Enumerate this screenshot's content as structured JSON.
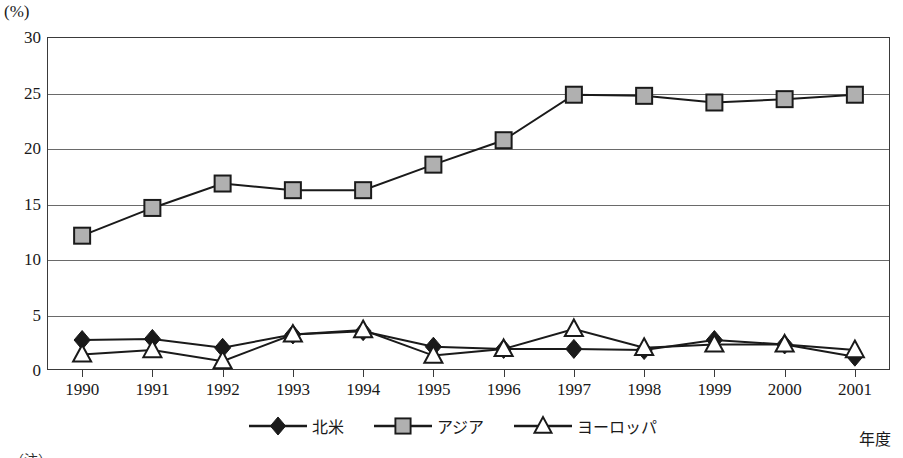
{
  "axes": {
    "y_unit_label": "(%)",
    "y_ticks": [
      "0",
      "5",
      "10",
      "15",
      "20",
      "25",
      "30"
    ],
    "y_min": 0,
    "y_max": 30,
    "y_step": 5,
    "x_axis_title": "年度",
    "x_ticks": [
      "1990",
      "1991",
      "1992",
      "1993",
      "1994",
      "1995",
      "1996",
      "1997",
      "1998",
      "1999",
      "2000",
      "2001"
    ]
  },
  "legend": {
    "position": "bottom-center",
    "entries": [
      {
        "label": "北米",
        "marker": "diamond",
        "color": "#1a1a1a"
      },
      {
        "label": "アジア",
        "marker": "square",
        "color": "#b0b0b0"
      },
      {
        "label": "ヨーロッパ",
        "marker": "triangle",
        "color": "#ffffff"
      }
    ]
  },
  "footnote": "（注）",
  "colors": {
    "line": "#1a1a1a",
    "grid": "#6a6a6a",
    "frame": "#3a3a3a",
    "square_fill": "#b0b0b0",
    "diamond_fill": "#1a1a1a",
    "triangle_fill": "#ffffff"
  },
  "chart_data": {
    "type": "line",
    "title": "",
    "xlabel": "年度",
    "ylabel": "(%)",
    "ylim": [
      0,
      30
    ],
    "grid": true,
    "legend_position": "bottom-center",
    "x": [
      "1990",
      "1991",
      "1992",
      "1993",
      "1994",
      "1995",
      "1996",
      "1997",
      "1998",
      "1999",
      "2000",
      "2001"
    ],
    "series": [
      {
        "name": "北米",
        "marker": "diamond",
        "values": [
          2.7,
          2.8,
          2.0,
          3.2,
          3.5,
          2.1,
          1.9,
          1.9,
          1.8,
          2.7,
          2.3,
          1.2
        ]
      },
      {
        "name": "アジア",
        "marker": "square",
        "values": [
          12.1,
          14.6,
          16.8,
          16.2,
          16.2,
          18.5,
          20.7,
          24.8,
          24.7,
          24.1,
          24.4,
          24.8
        ]
      },
      {
        "name": "ヨーロッパ",
        "marker": "triangle",
        "values": [
          1.4,
          1.8,
          0.8,
          3.2,
          3.6,
          1.3,
          1.9,
          3.7,
          2.0,
          2.3,
          2.3,
          1.8
        ]
      }
    ]
  }
}
